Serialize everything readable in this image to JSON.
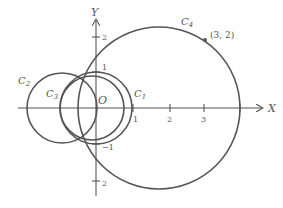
{
  "diagram": {
    "type": "coaxial-circles",
    "axes": {
      "x_label": "X",
      "y_label": "Y",
      "origin_label": "O",
      "x_ticks": [
        {
          "value": 1,
          "label": "1"
        },
        {
          "value": 2,
          "label": "2"
        },
        {
          "value": 3,
          "label": "3"
        }
      ],
      "y_ticks": [
        {
          "value": 2,
          "label": "2"
        },
        {
          "value": 1,
          "label": "1"
        },
        {
          "value": -1,
          "label": "−1"
        },
        {
          "value": -2,
          "label": "2"
        }
      ]
    },
    "circles": [
      {
        "name": "C",
        "sub": "1",
        "center": [
          0,
          0
        ],
        "radius": 1
      },
      {
        "name": "C",
        "sub": "2",
        "center": [
          -0.94,
          0
        ],
        "radius": 0.97
      },
      {
        "name": "C",
        "sub": "3",
        "center": [
          -0.12,
          0
        ],
        "radius": 0.88
      },
      {
        "name": "C",
        "sub": "4",
        "center": [
          1.75,
          0
        ],
        "radius": 2.25
      }
    ],
    "point": {
      "label": "(3, 2)",
      "x": 3,
      "y": 2
    },
    "stroke_color": "#555555"
  }
}
